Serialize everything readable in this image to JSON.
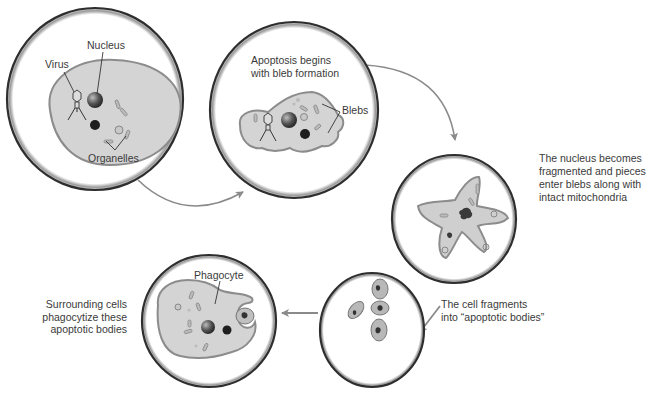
{
  "diagram": {
    "colors": {
      "circle_border": "#2e2e2e",
      "cell_fill": "#d4d4d4",
      "cell_edge": "#8c8c8c",
      "arrow": "#8a8a8a",
      "text": "#3a3a3a"
    },
    "stages": [
      {
        "id": "stage-1",
        "labels": {
          "nucleus": "Nucleus",
          "virus": "Virus",
          "organelles": "Organelles"
        }
      },
      {
        "id": "stage-2",
        "caption_lines": [
          "Apoptosis begins",
          "with bleb formation"
        ],
        "labels": {
          "blebs": "Blebs"
        }
      },
      {
        "id": "stage-3",
        "caption_lines": [
          "The nucleus becomes",
          "fragmented and pieces",
          "enter blebs along with",
          "intact mitochondria"
        ]
      },
      {
        "id": "stage-4",
        "caption_lines": [
          "The cell fragments",
          "into “apoptotic bodies”"
        ]
      },
      {
        "id": "stage-5",
        "caption_lines": [
          "Surrounding cells",
          "phagocytize these",
          "apoptotic bodies"
        ],
        "labels": {
          "phagocyte": "Phagocyte"
        }
      }
    ],
    "flow": [
      "stage-1 -> stage-2",
      "stage-2 -> stage-3",
      "stage-3 -> stage-4",
      "stage-4 -> stage-5"
    ]
  }
}
